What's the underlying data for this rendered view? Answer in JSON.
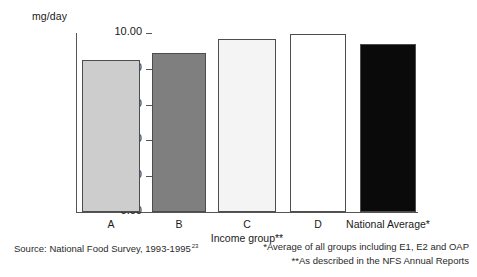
{
  "chart_data": {
    "type": "bar",
    "title": "",
    "subtitle": "",
    "xlabel": "Income group**",
    "ylabel": "mg/day",
    "ylim": [
      0,
      10
    ],
    "grid": false,
    "legend": "none",
    "categories": [
      "A",
      "B",
      "C",
      "D",
      "National Average*"
    ],
    "values": [
      8.5,
      8.9,
      9.65,
      9.95,
      9.4
    ],
    "ytick_labels": [
      "10.00",
      "8.00",
      "6.00",
      "4.00",
      "2.00",
      "0.00"
    ],
    "ytick_values": [
      10,
      8,
      6,
      4,
      2,
      0
    ],
    "bar_colors": [
      "#cdcdcd",
      "#7f7f7f",
      "#f4f4f4",
      "#ffffff",
      "#0a0a0a"
    ],
    "bar_edge_color": "#4d4d4d",
    "annotations": [
      "Source: National Food Survey, 1993-1995",
      "*Average of all groups including E1, E2 and OAP",
      "**As described in the NFS Annual Reports"
    ]
  },
  "axes": {
    "y_unit_label": "mg/day",
    "x_title": "Income group**"
  },
  "notes": {
    "source_text": "Source: National Food Survey, 1993-1995",
    "source_superscript": "23",
    "footnote_1": "*Average of all groups including E1, E2 and OAP",
    "footnote_2": "**As described in the NFS Annual Reports"
  }
}
